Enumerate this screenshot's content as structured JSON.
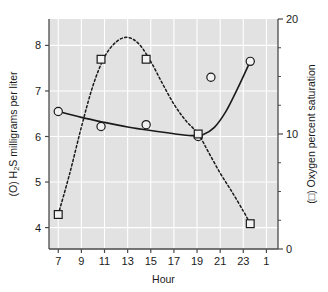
{
  "chart_data": {
    "type": "line",
    "title": "",
    "subtitle": "",
    "xlabel": "Hour",
    "ylabel_left": "(O) H2S milligrams per liter",
    "ylabel_left_parts": {
      "prefix": "(O) H",
      "subscript": "2",
      "suffix": "S milligrams per liter"
    },
    "ylabel_right": "(□) Oxygen percent saturation",
    "x_ticks": [
      "7",
      "9",
      "11",
      "13",
      "15",
      "17",
      "19",
      "21",
      "23",
      "1"
    ],
    "x_tick_values": [
      7,
      9,
      11,
      13,
      15,
      17,
      19,
      21,
      23,
      25
    ],
    "xlim": [
      6.2,
      26.0
    ],
    "y_left_ticks": [
      "4",
      "5",
      "6",
      "7",
      "8"
    ],
    "y_left_tick_values": [
      4,
      5,
      6,
      7,
      8
    ],
    "ylim_left": [
      3.53,
      8.58
    ],
    "y_right_ticks": [
      "0",
      "10",
      "20"
    ],
    "y_right_tick_values": [
      0,
      10,
      20
    ],
    "ylim_right": [
      0,
      20
    ],
    "grid": true,
    "grid_color": "#ffffff",
    "plot_bg": "#e2e2e2",
    "legend": "inline-in-axis-titles",
    "series": [
      {
        "name": "(O) H2S milligrams per liter",
        "marker": "circle",
        "line_style": "solid",
        "axis": "left",
        "color": "#1a1a1a",
        "points": [
          {
            "x": 7.0,
            "y": 6.55
          },
          {
            "x": 10.7,
            "y": 6.22
          },
          {
            "x": 14.6,
            "y": 6.26
          },
          {
            "x": 19.1,
            "y": 6.0
          },
          {
            "x": 20.2,
            "y": 7.3
          },
          {
            "x": 23.6,
            "y": 7.65
          }
        ],
        "fitted_curve": [
          {
            "x": 7.0,
            "y": 6.55
          },
          {
            "x": 9.0,
            "y": 6.42
          },
          {
            "x": 11.0,
            "y": 6.31
          },
          {
            "x": 13.0,
            "y": 6.21
          },
          {
            "x": 15.0,
            "y": 6.13
          },
          {
            "x": 17.0,
            "y": 6.06
          },
          {
            "x": 18.5,
            "y": 6.02
          },
          {
            "x": 19.5,
            "y": 6.04
          },
          {
            "x": 20.5,
            "y": 6.2
          },
          {
            "x": 21.5,
            "y": 6.55
          },
          {
            "x": 22.5,
            "y": 7.05
          },
          {
            "x": 23.6,
            "y": 7.65
          }
        ]
      },
      {
        "name": "(□) Oxygen percent saturation",
        "marker": "square",
        "line_style": "dashed",
        "axis": "right",
        "color": "#1a1a1a",
        "points": [
          {
            "x": 7.0,
            "y": 3.0
          },
          {
            "x": 10.7,
            "y": 16.5
          },
          {
            "x": 14.6,
            "y": 16.5
          },
          {
            "x": 19.1,
            "y": 10.0
          },
          {
            "x": 23.6,
            "y": 2.2
          }
        ],
        "points_left_scale": [
          {
            "x": 7.0,
            "y": 4.5
          },
          {
            "x": 10.7,
            "y": 7.78
          },
          {
            "x": 14.6,
            "y": 7.78
          },
          {
            "x": 19.1,
            "y": 6.0
          },
          {
            "x": 23.6,
            "y": 4.27
          }
        ],
        "fitted_curve": [
          {
            "x": 7.0,
            "y": 3.0
          },
          {
            "x": 8.0,
            "y": 6.6
          },
          {
            "x": 9.0,
            "y": 10.6
          },
          {
            "x": 10.0,
            "y": 14.2
          },
          {
            "x": 11.0,
            "y": 16.7
          },
          {
            "x": 12.0,
            "y": 18.0
          },
          {
            "x": 13.0,
            "y": 18.4
          },
          {
            "x": 14.0,
            "y": 17.8
          },
          {
            "x": 15.0,
            "y": 16.3
          },
          {
            "x": 16.0,
            "y": 14.4
          },
          {
            "x": 17.0,
            "y": 12.6
          },
          {
            "x": 18.0,
            "y": 11.2
          },
          {
            "x": 19.1,
            "y": 10.0
          },
          {
            "x": 20.0,
            "y": 8.4
          },
          {
            "x": 21.0,
            "y": 6.6
          },
          {
            "x": 22.0,
            "y": 5.0
          },
          {
            "x": 23.0,
            "y": 3.3
          },
          {
            "x": 23.6,
            "y": 2.2
          }
        ]
      }
    ]
  }
}
